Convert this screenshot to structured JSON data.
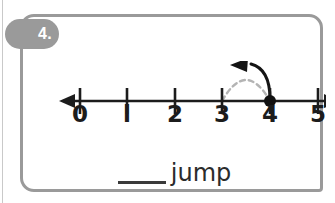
{
  "worksheet": {
    "problem_number": "4.",
    "badge_color": "#9a9a9a",
    "card_border_color": "#9a9a9a",
    "background_color": "#ffffff"
  },
  "number_line": {
    "min": 0,
    "max": 5,
    "ticks": [
      {
        "label": "0",
        "value": 0,
        "x": 57
      },
      {
        "label": "l",
        "value": 1,
        "x": 104
      },
      {
        "label": "2",
        "value": 2,
        "x": 152
      },
      {
        "label": "3",
        "value": 3,
        "x": 199
      },
      {
        "label": "4",
        "value": 4,
        "x": 247
      },
      {
        "label": "5",
        "value": 5,
        "x": 295
      }
    ],
    "axis_color": "#1c1c1c",
    "left_arrow": true,
    "right_arrow": true,
    "point": {
      "value": 4,
      "x": 247,
      "color": "#111111",
      "radius": 6
    },
    "jump_arc": {
      "from_value": 4,
      "to_value": 3,
      "direction": "left",
      "solid_color": "#111111",
      "dashed_color": "#b4b4b4",
      "arrowhead": "left"
    }
  },
  "prompt": {
    "blank": "____",
    "word": "jump"
  }
}
